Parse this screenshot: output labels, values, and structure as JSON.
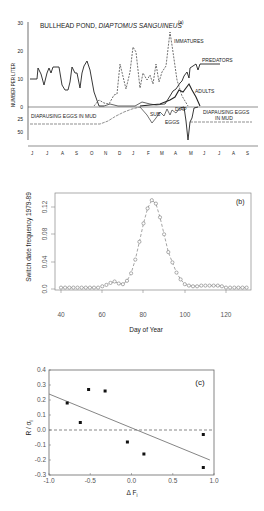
{
  "chart_data": [
    {
      "panel": "(a)",
      "type": "line",
      "title": "BULLHEAD POND, DIAPTOMUS SANGUINEUS",
      "ylabel": "NUMBER PER LITER",
      "xlabel": "",
      "categories": [
        "J",
        "J",
        "A",
        "S",
        "O",
        "N",
        "D",
        "J",
        "F",
        "M",
        "A",
        "M",
        "J",
        "J",
        "A",
        "S"
      ],
      "ylim_upper": [
        0,
        30
      ],
      "yticks_upper": [
        "30",
        "20",
        "10",
        "0"
      ],
      "yticks_lower": [
        "25",
        "50"
      ],
      "annotations": [
        "IMMATURES",
        "PREDATORS",
        "ADULTS",
        "DIAPAUSING EGGS IN MUD",
        "SUB",
        "EGGS",
        "DIAP",
        "DIAPAUSING EGGS IN MUD"
      ],
      "series": [
        {
          "name": "Predators",
          "style": "solid",
          "values": [
            10,
            10,
            14,
            12,
            8,
            14,
            12,
            14,
            14,
            7,
            6,
            7,
            14,
            12,
            8,
            14,
            16,
            13,
            1,
            0,
            0,
            0,
            0,
            0,
            1,
            1,
            1,
            1,
            2,
            4,
            6,
            8,
            10,
            12,
            13,
            14,
            15,
            15,
            15
          ]
        },
        {
          "name": "Immatures",
          "style": "dashed",
          "values": [
            0,
            0,
            0,
            0,
            2,
            1,
            1,
            5,
            15,
            7,
            22,
            6,
            12,
            10,
            8,
            15,
            9,
            27,
            12,
            5,
            1,
            0
          ]
        },
        {
          "name": "Adults",
          "style": "solid",
          "values": [
            0,
            0,
            1,
            0,
            0,
            1,
            2,
            4,
            6,
            9,
            5,
            1,
            0
          ]
        },
        {
          "name": "Diapausing eggs in mud",
          "style": "solid",
          "values": [
            -28,
            -28,
            -28,
            -25,
            -15,
            -8,
            -5,
            -5
          ]
        },
        {
          "name": "Sub-itaneous eggs",
          "style": "solid",
          "values": [
            -5,
            -15,
            -30,
            -10,
            -20,
            -12,
            -25,
            -10
          ]
        },
        {
          "name": "Diapausing eggs",
          "style": "solid",
          "values": [
            0,
            -10,
            -55,
            -25,
            -25,
            -25,
            -25
          ]
        }
      ]
    },
    {
      "panel": "(b)",
      "type": "line",
      "title": "",
      "xlabel": "Day of Year",
      "ylabel": "Switch date frequency 1979-89",
      "xlim": [
        40,
        130
      ],
      "ylim": [
        0,
        0.13
      ],
      "xticks": [
        "40",
        "60",
        "80",
        "100",
        "120"
      ],
      "yticks": [
        "0.0",
        "0.04",
        "0.08",
        "0.12"
      ],
      "x": [
        40,
        42,
        44,
        46,
        48,
        50,
        52,
        54,
        56,
        58,
        60,
        62,
        64,
        66,
        68,
        70,
        72,
        74,
        76,
        78,
        80,
        82,
        84,
        86,
        88,
        90,
        92,
        94,
        96,
        98,
        100,
        102,
        104,
        106,
        108,
        110,
        112,
        114,
        116,
        118,
        120,
        122,
        124,
        126,
        128,
        130
      ],
      "values": [
        0.002,
        0.002,
        0.002,
        0.002,
        0.002,
        0.002,
        0.002,
        0.002,
        0.002,
        0.002,
        0.004,
        0.006,
        0.009,
        0.011,
        0.008,
        0.007,
        0.012,
        0.023,
        0.043,
        0.069,
        0.096,
        0.118,
        0.13,
        0.125,
        0.105,
        0.08,
        0.054,
        0.039,
        0.024,
        0.014,
        0.007,
        0.005,
        0.004,
        0.004,
        0.005,
        0.005,
        0.005,
        0.005,
        0.005,
        0.004,
        0.002,
        0.002,
        0.002,
        0.002,
        0.002,
        0.002
      ]
    },
    {
      "panel": "(c)",
      "type": "scatter",
      "title": "",
      "xlabel": "ΔF_i",
      "ylabel": "R/σ_i",
      "xlim": [
        -1.0,
        1.0
      ],
      "ylim": [
        -0.3,
        0.4
      ],
      "xticks": [
        "-1.0",
        "-0.5",
        "0.0",
        "0.5",
        "1.0"
      ],
      "yticks": [
        "0.4",
        "0.3",
        "0.2",
        "0.1",
        "0.0",
        "-0.1",
        "-0.2",
        "-0.3"
      ],
      "points": [
        {
          "x": -0.78,
          "y": 0.18
        },
        {
          "x": -0.62,
          "y": 0.05
        },
        {
          "x": -0.52,
          "y": 0.27
        },
        {
          "x": -0.32,
          "y": 0.26
        },
        {
          "x": -0.05,
          "y": -0.08
        },
        {
          "x": 0.15,
          "y": -0.16
        },
        {
          "x": 0.87,
          "y": -0.03
        },
        {
          "x": 0.87,
          "y": -0.25
        }
      ],
      "fit_line": {
        "x": [
          -1.0,
          0.95
        ],
        "y": [
          0.24,
          -0.2
        ]
      },
      "reference_line": {
        "y": 0.0,
        "style": "dashed"
      }
    }
  ],
  "labels": {
    "a_title_1": "BULLHEAD POND, ",
    "a_title_2": "DIAPTOMUS SANGUINEUS",
    "a_panel": "(a)",
    "a_ylabel": "NUMBER PER LITER",
    "a_immatures": "IMMATURES",
    "a_predators": "PREDATORS",
    "a_adults": "ADULTS",
    "a_diap_mud_left": "DIAPAUSING EGGS IN MUD",
    "a_sub": "SUB",
    "a_eggs": "EGGS",
    "a_diap": "DIAP",
    "a_diap_mud_right_1": "DIAPAUSING EGGS",
    "a_diap_mud_right_2": "IN MUD",
    "a_yt_30": "30",
    "a_yt_20": "20",
    "a_yt_10": "10",
    "a_yt_0": "0",
    "a_yt_25": "25",
    "a_yt_50": "50",
    "a_months": [
      "J",
      "J",
      "A",
      "S",
      "O",
      "N",
      "D",
      "J",
      "F",
      "M",
      "A",
      "M",
      "J",
      "J",
      "A",
      "S"
    ],
    "b_panel": "(b)",
    "b_ylabel": "Switch date frequency 1979-89",
    "b_xlabel": "Day of Year",
    "b_yt": [
      "0.0",
      "0.04",
      "0.08",
      "0.12"
    ],
    "b_xt": [
      "40",
      "60",
      "80",
      "100",
      "120"
    ],
    "c_panel": "(c)",
    "c_ylabel": "R / σ",
    "c_ylabel_sub": "i",
    "c_xlabel": "Δ F",
    "c_xlabel_sub": "i",
    "c_yt": [
      "0.4",
      "0.3",
      "0.2",
      "0.1",
      "0.0",
      "-0.1",
      "-0.2",
      "-0.3"
    ],
    "c_xt": [
      "-1.0",
      "-0.5",
      "0.0",
      "0.5",
      "1.0"
    ]
  }
}
